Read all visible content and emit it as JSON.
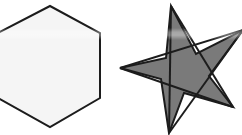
{
  "canvas": {
    "width": 242,
    "height": 135,
    "background_color": "#ffffff",
    "title": "Two geometric shapes: an outlined hexagon and a filled five-pointed star"
  },
  "palette": {
    "outline_color": "#1c1c1c",
    "hexagon_fill": "#f5f5f5",
    "star_fill": "#7a7a7a",
    "background": "#ffffff"
  },
  "artifacts": {
    "scan_band": {
      "label": "horizontal-light-band",
      "y": 28,
      "height": 12,
      "opacity": 0.6
    }
  },
  "shapes": [
    {
      "id": "hexagon",
      "label": "Hexagon",
      "type": "polygon",
      "sides": 6,
      "fill": "#f5f5f5",
      "stroke": "#1c1c1c",
      "stroke_width": 2,
      "clipped_at_left_edge": true,
      "points": "50,6 100,33 100,98 50,127 -2,98 -2,33"
    },
    {
      "id": "star",
      "label": "Five-pointed star",
      "type": "pentagram",
      "points_count": 5,
      "fill": "#7a7a7a",
      "stroke": "#1c1c1c",
      "stroke_width": 2,
      "clipped_at_right_edge": true,
      "tips": [
        {
          "name": "top",
          "x": 171,
          "y": 6
        },
        {
          "name": "upper-right",
          "x": 243,
          "y": 30
        },
        {
          "name": "lower-right",
          "x": 233,
          "y": 107
        },
        {
          "name": "bottom-left",
          "x": 169,
          "y": 133
        },
        {
          "name": "left",
          "x": 120,
          "y": 68
        }
      ],
      "outline_points": "171,6 196,54 243,30 209,76 233,107 184,93 169,133 161,79 120,68 166,58",
      "chord_lines": [
        {
          "from": "top",
          "to": "lower-right",
          "x1": 171,
          "y1": 6,
          "x2": 233,
          "y2": 107
        },
        {
          "from": "top",
          "to": "bottom-left",
          "x1": 171,
          "y1": 6,
          "x2": 169,
          "y2": 133
        },
        {
          "from": "upper-right",
          "to": "bottom-left",
          "x1": 243,
          "y1": 30,
          "x2": 169,
          "y2": 133
        },
        {
          "from": "upper-right",
          "to": "left",
          "x1": 243,
          "y1": 30,
          "x2": 120,
          "y2": 68
        },
        {
          "from": "lower-right",
          "to": "left",
          "x1": 233,
          "y1": 107,
          "x2": 120,
          "y2": 68
        }
      ]
    }
  ]
}
